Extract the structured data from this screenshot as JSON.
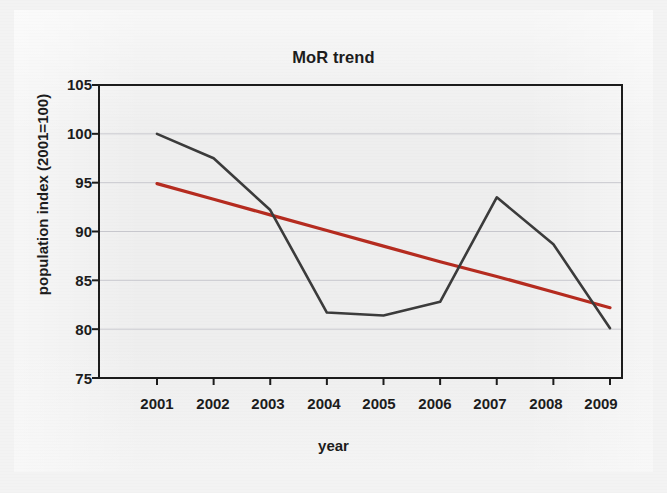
{
  "chart_data": {
    "type": "line",
    "title": "MoR trend",
    "xlabel": "year",
    "ylabel": "population index (2001=100)",
    "categories": [
      "2001",
      "2002",
      "2003",
      "2004",
      "2005",
      "2006",
      "2007",
      "2008",
      "2009"
    ],
    "x": [
      2001,
      2002,
      2003,
      2004,
      2005,
      2006,
      2007,
      2008,
      2009
    ],
    "xlim": [
      2001,
      2009
    ],
    "ylim": [
      75,
      105
    ],
    "y_ticks": [
      105,
      100,
      95,
      90,
      85,
      80,
      75
    ],
    "x_ticks": [
      "2001",
      "2002",
      "2003",
      "2004",
      "2005",
      "2006",
      "2007",
      "2008",
      "2009"
    ],
    "grid": "horizontal",
    "legend": "none",
    "series": [
      {
        "name": "population index",
        "color": "#3a3a3a",
        "style": "solid",
        "values": [
          100.0,
          97.5,
          92.2,
          81.7,
          81.4,
          82.8,
          93.5,
          88.7,
          80.1
        ]
      },
      {
        "name": "linear trend",
        "color": "#b52a1e",
        "style": "trendline",
        "values": [
          94.9,
          93.3,
          91.7,
          90.1,
          88.5,
          86.9,
          85.4,
          83.8,
          82.2
        ]
      }
    ]
  },
  "axes": {
    "y_tick_labels": [
      "105",
      "100",
      "95",
      "90",
      "85",
      "80",
      "75"
    ],
    "x_tick_labels": [
      "2001",
      "2002",
      "2003",
      "2004",
      "2005",
      "2006",
      "2007",
      "2008",
      "2009"
    ]
  },
  "colors": {
    "series_line": "#3a3a3a",
    "trend_line": "#b52a1e",
    "axis": "#1b1b1b",
    "gridline": "#c9c9cf",
    "plot_background": "#eeeeee",
    "page_background": "#f3f3f3"
  }
}
